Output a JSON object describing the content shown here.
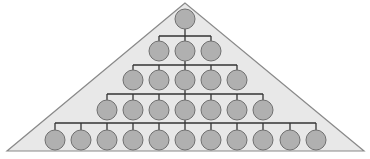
{
  "diagram": {
    "type": "hierarchy-pyramid",
    "colors": {
      "background": "#ffffff",
      "triangle_fill": "#e8e8e8",
      "triangle_stroke": "#8a8a8a",
      "node_fill": "#b0b0b0",
      "node_stroke": "#707070",
      "connector": "#333333"
    },
    "triangle": {
      "apex": [
        185,
        3
      ],
      "base_left": [
        7,
        151
      ],
      "base_right": [
        364,
        151
      ]
    },
    "node_radius": 10,
    "levels": [
      {
        "y": 19,
        "bar_y": null,
        "nodes": [
          185
        ]
      },
      {
        "y": 51,
        "bar_y": 36,
        "nodes": [
          159,
          185,
          211
        ]
      },
      {
        "y": 80,
        "bar_y": 65,
        "nodes": [
          133,
          159,
          185,
          211,
          237
        ]
      },
      {
        "y": 110,
        "bar_y": 94,
        "nodes": [
          107,
          133,
          159,
          185,
          211,
          237,
          263
        ]
      },
      {
        "y": 140,
        "bar_y": 123,
        "nodes": [
          55,
          81,
          107,
          133,
          159,
          185,
          211,
          237,
          263,
          290,
          316
        ]
      }
    ]
  }
}
